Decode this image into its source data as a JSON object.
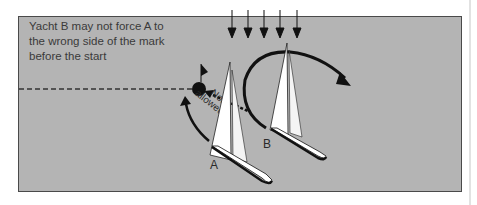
{
  "caption": {
    "line1": "Yacht B may not force A to",
    "line2": "the wrong side of the mark",
    "line3": "before the start"
  },
  "labels": {
    "yacht_a": "A",
    "yacht_b": "B",
    "not_allowed_1": "Not",
    "not_allowed_2": "allowed"
  },
  "colors": {
    "background": "#ffffff",
    "panel": "#b4b4b4",
    "panel_border": "#4a4a4a",
    "ink": "#111111",
    "sail": "#ffffff"
  }
}
